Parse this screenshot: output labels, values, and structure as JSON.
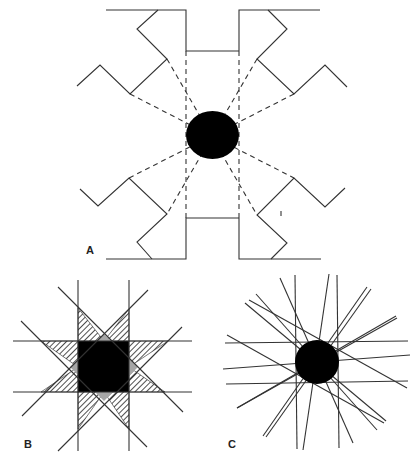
{
  "panels": {
    "A": {
      "label": "A"
    },
    "B": {
      "label": "B"
    },
    "C": {
      "label": "C"
    }
  },
  "colors": {
    "line": "#333333",
    "fill_black": "#000000",
    "fill_gray": "#a6a6a6",
    "hatch": "#222222",
    "background": "#ffffff"
  }
}
